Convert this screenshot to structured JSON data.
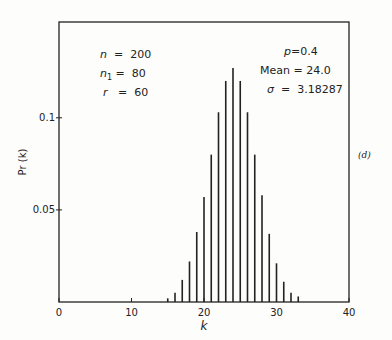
{
  "chart_data": {
    "type": "bar",
    "title": "",
    "xlabel": "k",
    "ylabel": "Pr (k)",
    "xlim": [
      0,
      40
    ],
    "ylim": [
      0,
      0.152
    ],
    "x_ticks": [
      0,
      10,
      20,
      30,
      40
    ],
    "x_tick_labels": [
      "0",
      "10",
      "20",
      "30",
      "40"
    ],
    "y_ticks": [
      0.05,
      0.1
    ],
    "y_tick_labels": [
      "0.05",
      "0.1"
    ],
    "grid": false,
    "panel_label": "(d)",
    "x": [
      15,
      16,
      17,
      18,
      19,
      20,
      21,
      22,
      23,
      24,
      25,
      26,
      27,
      28,
      29,
      30,
      31,
      32,
      33
    ],
    "values": [
      0.002,
      0.005,
      0.012,
      0.022,
      0.038,
      0.057,
      0.08,
      0.103,
      0.12,
      0.127,
      0.12,
      0.103,
      0.08,
      0.058,
      0.037,
      0.021,
      0.011,
      0.005,
      0.003
    ],
    "annotations": {
      "left": [
        {
          "sym": "n",
          "sub": "",
          "eq": "=",
          "val": "200"
        },
        {
          "sym": "n",
          "sub": "1",
          "eq": "=",
          "val": "80"
        },
        {
          "sym": "r",
          "sub": "",
          "eq": "=",
          "val": "60"
        }
      ],
      "right": [
        {
          "sym": "p",
          "eq": "=",
          "val": "0.4"
        },
        {
          "sym": "Mean",
          "eq": "=",
          "val": "24.0"
        },
        {
          "sym": "σ",
          "eq": "=",
          "val": "3.18287"
        }
      ]
    }
  },
  "colors": {
    "ink": "#222222",
    "background": "#fdfdfc"
  }
}
